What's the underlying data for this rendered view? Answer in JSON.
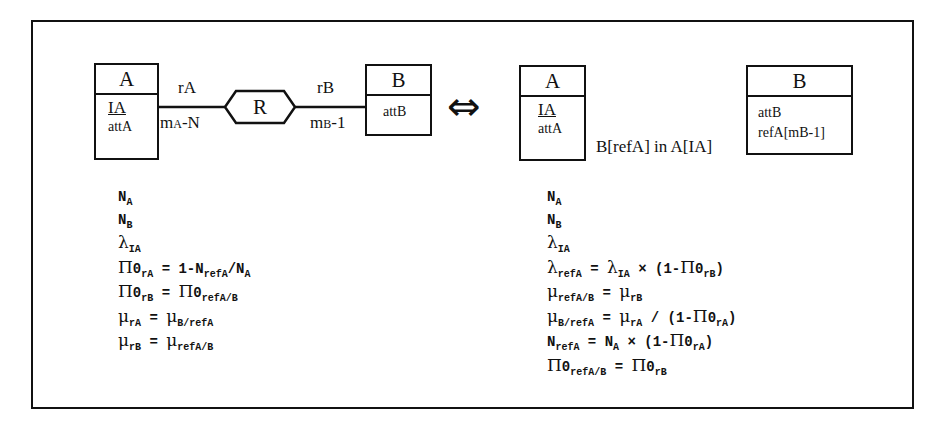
{
  "left_diagram": {
    "entity_a": {
      "name": "A",
      "attributes": [
        {
          "text": "IA",
          "key": true
        },
        {
          "text": "attA",
          "key": false
        }
      ]
    },
    "entity_b": {
      "name": "B",
      "attributes": [
        {
          "text": "attB",
          "key": false
        }
      ]
    },
    "relationship": {
      "name": "R"
    },
    "role_a": "rA",
    "role_b": "rB",
    "card_a": {
      "m": "m",
      "sub": "A",
      "rest": "-N"
    },
    "card_b": {
      "m": "m",
      "sub": "B",
      "rest": "-1"
    }
  },
  "equivalence_symbol": "⇔",
  "right_diagram": {
    "entity_a": {
      "name": "A",
      "attributes": [
        {
          "text": "IA",
          "key": true
        },
        {
          "text": "attA",
          "key": false
        }
      ]
    },
    "entity_b": {
      "name": "B",
      "attributes": [
        {
          "text": "attB",
          "key": false
        },
        {
          "text": "refA[mB-1]",
          "key": false
        }
      ]
    },
    "inclusion_constraint": "B[refA] in A[IA]"
  },
  "left_formulas": [
    {
      "parts": [
        {
          "t": "N"
        },
        {
          "s": "A"
        }
      ]
    },
    {
      "parts": [
        {
          "t": "N"
        },
        {
          "s": "B"
        }
      ]
    },
    {
      "parts": [
        {
          "g": "λ"
        },
        {
          "s": "IA"
        }
      ]
    },
    {
      "parts": [
        {
          "g": "Π"
        },
        {
          "t": "0"
        },
        {
          "s": "rA"
        },
        {
          "t": " = 1-N"
        },
        {
          "s": "refA"
        },
        {
          "t": "/N"
        },
        {
          "s": "A"
        }
      ]
    },
    {
      "parts": [
        {
          "g": "Π"
        },
        {
          "t": "0"
        },
        {
          "s": "rB"
        },
        {
          "t": " = "
        },
        {
          "g": "Π"
        },
        {
          "t": "0"
        },
        {
          "s": "refA/B"
        }
      ]
    },
    {
      "parts": [
        {
          "g": "μ"
        },
        {
          "s": "rA"
        },
        {
          "t": " = "
        },
        {
          "g": "μ"
        },
        {
          "s": "B/refA"
        }
      ]
    },
    {
      "parts": [
        {
          "g": "μ"
        },
        {
          "s": "rB"
        },
        {
          "t": " = "
        },
        {
          "g": "μ"
        },
        {
          "s": "refA/B"
        }
      ]
    }
  ],
  "right_formulas": [
    {
      "parts": [
        {
          "t": "N"
        },
        {
          "s": "A"
        }
      ]
    },
    {
      "parts": [
        {
          "t": "N"
        },
        {
          "s": "B"
        }
      ]
    },
    {
      "parts": [
        {
          "g": "λ"
        },
        {
          "s": "IA"
        }
      ]
    },
    {
      "parts": [
        {
          "g": "λ"
        },
        {
          "s": "refA"
        },
        {
          "t": " = "
        },
        {
          "g": "λ"
        },
        {
          "s": "IA"
        },
        {
          "t": " × (1-"
        },
        {
          "g": "Π"
        },
        {
          "t": "0"
        },
        {
          "s": "rB"
        },
        {
          "t": ")"
        }
      ]
    },
    {
      "parts": [
        {
          "g": "μ"
        },
        {
          "s": "refA/B"
        },
        {
          "t": " = "
        },
        {
          "g": "μ"
        },
        {
          "s": "rB"
        }
      ]
    },
    {
      "parts": [
        {
          "g": "μ"
        },
        {
          "s": "B/refA"
        },
        {
          "t": " = "
        },
        {
          "g": "μ"
        },
        {
          "s": "rA"
        },
        {
          "t": " / (1-"
        },
        {
          "g": "Π"
        },
        {
          "t": "0"
        },
        {
          "s": "rA"
        },
        {
          "t": ")"
        }
      ]
    },
    {
      "parts": [
        {
          "t": "N"
        },
        {
          "s": "refA"
        },
        {
          "t": " = N"
        },
        {
          "s": "A"
        },
        {
          "t": " × (1-"
        },
        {
          "g": "Π"
        },
        {
          "t": "0"
        },
        {
          "s": "rA"
        },
        {
          "t": ")"
        }
      ]
    },
    {
      "parts": [
        {
          "g": "Π"
        },
        {
          "t": "0"
        },
        {
          "s": "refA/B"
        },
        {
          "t": " = "
        },
        {
          "g": "Π"
        },
        {
          "t": "0"
        },
        {
          "s": "rB"
        }
      ]
    }
  ]
}
